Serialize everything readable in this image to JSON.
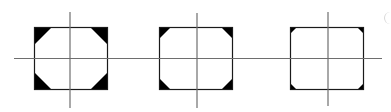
{
  "diagram": {
    "colors": {
      "background": "#ffffff",
      "outline": "#1a1a1a",
      "axis": "#6e6e6e",
      "corner_fill": "#000000"
    },
    "horizontal_axis": {
      "y": 58.5,
      "x1": 14,
      "x2": 382
    },
    "figures": [
      {
        "id": "square-1",
        "x": 34,
        "y": 27,
        "w": 74,
        "h": 63,
        "corner": 18,
        "vaxis_x": 70,
        "vaxis_y1": 12,
        "vaxis_y2": 108
      },
      {
        "id": "square-2",
        "x": 159,
        "y": 27,
        "w": 74,
        "h": 63,
        "corner": 12,
        "vaxis_x": 197,
        "vaxis_y1": 13,
        "vaxis_y2": 108
      },
      {
        "id": "square-3",
        "x": 290,
        "y": 27,
        "w": 74,
        "h": 63,
        "corner": 7,
        "vaxis_x": 328,
        "vaxis_y1": 12,
        "vaxis_y2": 106
      }
    ]
  }
}
